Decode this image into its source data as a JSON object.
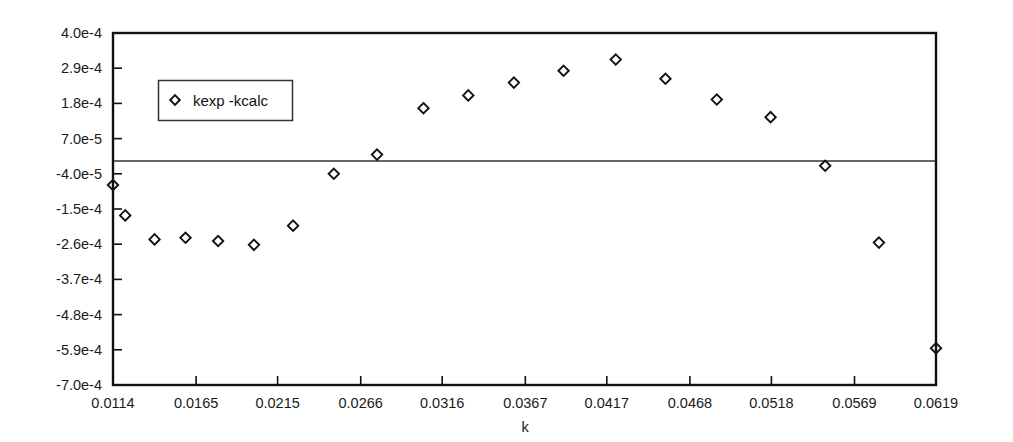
{
  "chart_data": {
    "type": "scatter",
    "title": "",
    "xlabel": "k",
    "ylabel": "",
    "grid": false,
    "legend_position": "upper-left-inside",
    "xlim": [
      0.0114,
      0.0619
    ],
    "ylim": [
      -0.0007,
      0.0004
    ],
    "xticks": [
      "0.0114",
      "0.0165",
      "0.0215",
      "0.0266",
      "0.0316",
      "0.0367",
      "0.0417",
      "0.0468",
      "0.0518",
      "0.0569",
      "0.0619"
    ],
    "xtick_values": [
      0.0114,
      0.0165,
      0.0215,
      0.0266,
      0.0316,
      0.0367,
      0.0417,
      0.0468,
      0.0518,
      0.0569,
      0.0619
    ],
    "yticks": [
      "4.0e-4",
      "2.9e-4",
      "1.8e-4",
      "7.0e-5",
      "-4.0e-5",
      "-1.5e-4",
      "-2.6e-4",
      "-3.7e-4",
      "-4.8e-4",
      "-5.9e-4",
      "-7.0e-4"
    ],
    "ytick_values": [
      0.0004,
      0.00029,
      0.00018,
      7e-05,
      -4e-05,
      -0.00015,
      -0.00026,
      -0.00037,
      -0.00048,
      -0.00059,
      -0.0007
    ],
    "zero_reference_line": 0.0,
    "marker_style": "open-diamond",
    "marker_color": "#111111",
    "series": [
      {
        "name": "kexp -kcalc",
        "x": [
          0.0114,
          0.01215,
          0.01395,
          0.01585,
          0.01785,
          0.02005,
          0.02245,
          0.02495,
          0.0276,
          0.03045,
          0.0332,
          0.036,
          0.03905,
          0.04225,
          0.0453,
          0.04845,
          0.05175,
          0.0551,
          0.0584,
          0.0619
        ],
        "y": [
          -7.5e-05,
          -0.00017,
          -0.000245,
          -0.00024,
          -0.00025,
          -0.000262,
          -0.000202,
          -4e-05,
          2e-05,
          0.000165,
          0.000205,
          0.000245,
          0.000282,
          0.000317,
          0.000257,
          0.000192,
          0.000137,
          -1.5e-05,
          -0.000255,
          -0.000585
        ]
      }
    ]
  },
  "legend": {
    "entries": [
      {
        "label": "kexp -kcalc",
        "marker": "open-diamond-icon"
      }
    ]
  },
  "axis": {
    "x_title": "k"
  }
}
